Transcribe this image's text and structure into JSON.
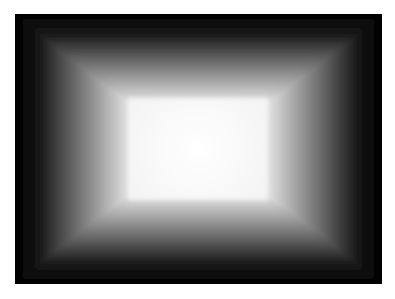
{
  "image": {
    "description": "Grayscale gradient frame: black outer border fading to a bright white rectangular center, forming a pyramid/tunnel-like bevel",
    "colors": {
      "background": "#ffffff",
      "outer": "#000000",
      "center": "#ffffff"
    },
    "frame": {
      "x": 15,
      "y": 14,
      "width": 367,
      "height": 270
    },
    "center_rect": {
      "x": 113,
      "y": 84,
      "width": 140,
      "height": 102
    }
  }
}
